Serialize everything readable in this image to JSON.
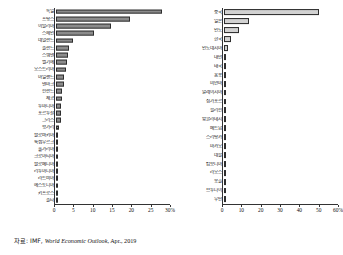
{
  "source_note": {
    "prefix": "자료: IMF, ",
    "publication": "World Economic Outlook",
    "suffix": ", Apr., 2019"
  },
  "chart_data": [
    {
      "type": "bar",
      "orientation": "horizontal",
      "panel": "left",
      "title": "",
      "xlabel": "",
      "ylabel": "",
      "xlim": [
        0,
        30
      ],
      "unit": "%",
      "grid": false,
      "legend": "none",
      "axis_ticks": [
        0,
        5,
        10,
        15,
        20,
        25,
        30
      ],
      "axis_tick_labels": [
        "0",
        "5",
        "10",
        "15",
        "20",
        "25",
        "30%"
      ],
      "categories": [
        "독일",
        "프랑스",
        "이탈리아",
        "스페인",
        "네덜란드",
        "폴란드",
        "스웨덴",
        "벨기에",
        "오스트리아",
        "아일랜드",
        "덴마크",
        "핀란드",
        "체코",
        "루마니아",
        "포르투갈",
        "그리스",
        "헝가리",
        "슬로바키아",
        "룩셈부르크",
        "불가리아",
        "크로아티아",
        "슬로베니아",
        "리투아니아",
        "라트비아",
        "에스토니아",
        "키프로스",
        "몰타"
      ],
      "values": [
        27.8,
        19.4,
        14.5,
        9.9,
        4.6,
        3.3,
        3.2,
        3.0,
        2.6,
        2.2,
        2.1,
        1.6,
        1.5,
        1.4,
        1.3,
        1.2,
        0.9,
        0.6,
        0.4,
        0.4,
        0.4,
        0.3,
        0.3,
        0.2,
        0.2,
        0.15,
        0.1
      ]
    },
    {
      "type": "bar",
      "orientation": "horizontal",
      "panel": "right",
      "title": "",
      "xlabel": "",
      "ylabel": "",
      "xlim": [
        0,
        60
      ],
      "unit": "%",
      "grid": false,
      "legend": "none",
      "axis_ticks": [
        0,
        10,
        20,
        30,
        40,
        50,
        60
      ],
      "axis_tick_labels": [
        "0",
        "10",
        "20",
        "30",
        "40",
        "50",
        "60%"
      ],
      "categories": [
        "중국",
        "일본",
        "인도",
        "한국",
        "인도네시아",
        "대만",
        "태국",
        "홍콩",
        "미얀마",
        "말레이시아",
        "싱가포르",
        "필리핀",
        "방글라데시",
        "베트남",
        "스리랑카",
        "마카오",
        "네팔",
        "캄보디아",
        "라오스",
        "몽골",
        "브루나이",
        "부탄"
      ],
      "values": [
        50.0,
        13.3,
        8.1,
        3.5,
        2.3,
        1.3,
        1.1,
        0.9,
        0.9,
        0.8,
        0.8,
        0.8,
        0.7,
        0.7,
        0.4,
        0.2,
        0.15,
        0.15,
        0.1,
        0.1,
        0.08,
        0.05
      ]
    }
  ]
}
